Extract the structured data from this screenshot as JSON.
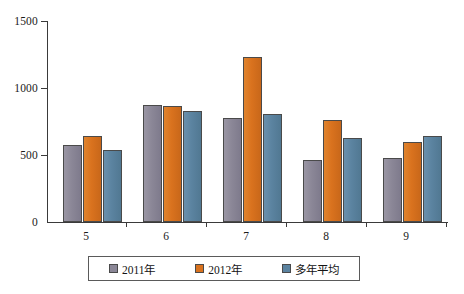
{
  "chart_data": {
    "type": "bar",
    "title": "",
    "subtitle": "",
    "xlabel": "",
    "ylabel": "",
    "categories": [
      "5",
      "6",
      "7",
      "8",
      "9"
    ],
    "ylim": [
      0,
      1500
    ],
    "yticks": [
      0,
      500,
      1000,
      1500
    ],
    "ytick_labels": [
      "0",
      "500",
      "1000",
      "1500"
    ],
    "grid": false,
    "legend_position": "bottom",
    "series": [
      {
        "name": "2011年",
        "color": "#8b8797",
        "values": [
          575,
          870,
          775,
          460,
          475
        ]
      },
      {
        "name": "2012年",
        "color": "#d9721e",
        "values": [
          645,
          865,
          1235,
          760,
          600
        ]
      },
      {
        "name": "多年平均",
        "color": "#5b83a0",
        "values": [
          535,
          825,
          805,
          625,
          640
        ]
      }
    ]
  },
  "axis": {
    "y_max_label": "1500",
    "y_mid_label": "1000",
    "y_low_label": "500",
    "y_zero_label": "0"
  },
  "legend": {
    "items": [
      {
        "label": "2011年",
        "color": "#8b8797"
      },
      {
        "label": "2012年",
        "color": "#d9721e"
      },
      {
        "label": "多年平均",
        "color": "#5b83a0"
      }
    ]
  }
}
